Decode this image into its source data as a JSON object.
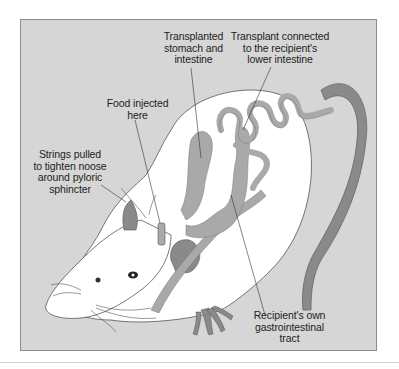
{
  "figure": {
    "background_color": "#d6d6d6",
    "border_color": "#8c8c8c",
    "organ_color": "#a9a9a9",
    "tail_color": "#8a8a8a",
    "body_color": "#ffffff",
    "labels": {
      "transplanted_stomach": "Transplanted\nstomach and\nintestine",
      "transplant_connected": "Transplant connected\nto the recipient's\nlower intestine",
      "food_injected": "Food injected\nhere",
      "strings_pulled": "Strings pulled\nto tighten noose\naround pyloric\nsphincter",
      "recipient_gi_tract": "Recipient's own\ngastrointestinal\ntract"
    },
    "illustration": {
      "subject": "rat",
      "elements": [
        "rat-body",
        "rat-head",
        "ears",
        "eye",
        "whiskers",
        "tail",
        "hind-foot",
        "transplanted-stomach",
        "transplanted-intestine",
        "recipient-gi-tract",
        "injection-port",
        "noose-strings"
      ]
    }
  }
}
